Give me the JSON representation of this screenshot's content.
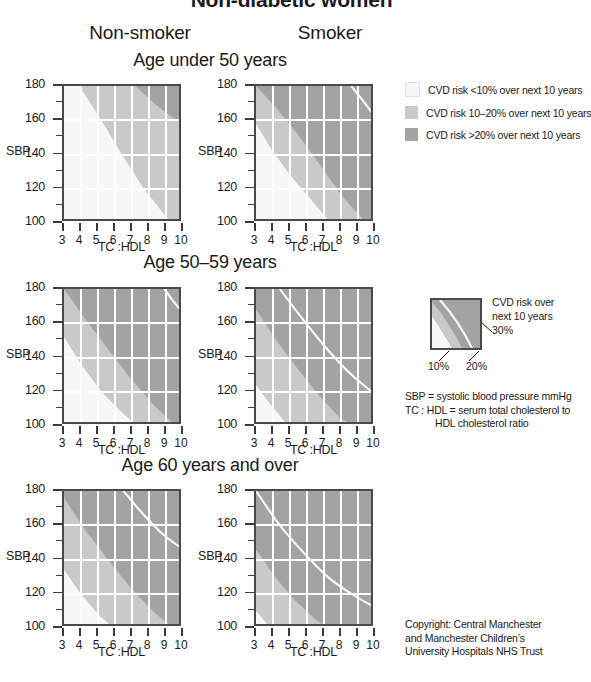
{
  "title": "Non-diabetic women",
  "columns": [
    {
      "label": "Non-smoker"
    },
    {
      "label": "Smoker"
    }
  ],
  "age_groups": [
    {
      "label": "Age under 50 years"
    },
    {
      "label": "Age 50–59 years"
    },
    {
      "label": "Age 60 years and over"
    }
  ],
  "axes": {
    "y_title": "SBP",
    "x_title": "TC :HDL",
    "y_ticks": [
      100,
      120,
      140,
      160,
      180
    ],
    "y_minor_step": 10,
    "y_min": 100,
    "y_max": 180,
    "x_ticks": [
      3,
      4,
      5,
      6,
      7,
      8,
      9,
      10
    ],
    "x_min": 3,
    "x_max": 10
  },
  "colors": {
    "risk_low": "#f7f7f7",
    "risk_mid": "#c9c9c9",
    "risk_high": "#a3a3a3",
    "border": "#4a4a4a",
    "gridline": "#ffffff",
    "contour": "#ffffff",
    "text": "#1a1a1a"
  },
  "legend": {
    "items": [
      {
        "swatch": "risk_low",
        "text": "CVD risk <10% over next 10 years"
      },
      {
        "swatch": "risk_mid",
        "text": "CVD risk 10–20% over next 10 years"
      },
      {
        "swatch": "risk_high",
        "text": "CVD risk >20% over next 10 years"
      }
    ]
  },
  "mini_key": {
    "line1": "CVD risk over",
    "line2": "next 10 years",
    "label_30": "30%",
    "label_10": "10%",
    "label_20": "20%"
  },
  "definitions": {
    "line1": "SBP = systolic blood pressure mmHg",
    "line2": "TC : HDL = serum total cholesterol to",
    "line3": "HDL cholesterol ratio"
  },
  "copyright": {
    "line1": "Copyright: Central Manchester",
    "line2": "and Manchester Children’s",
    "line3": "University Hospitals NHS Trust"
  },
  "chart_data": {
    "type": "heatmap",
    "title": "Non-diabetic women",
    "xlabel": "TC :HDL",
    "ylabel": "SBP",
    "xlim": [
      3,
      10
    ],
    "ylim": [
      100,
      180
    ],
    "grid": true,
    "legend_position": "right",
    "risk_bands": [
      {
        "name": "<10%",
        "color": "#f7f7f7"
      },
      {
        "name": "10-20%",
        "color": "#c9c9c9"
      },
      {
        "name": ">20%",
        "color": "#a3a3a3"
      }
    ],
    "panels": [
      {
        "id": "nonsmoker-under50",
        "age_group": "Age under 50 years",
        "smoking": "Non-smoker",
        "contours": [
          {
            "level": 10,
            "points": [
              [
                3.0,
                180
              ],
              [
                3.9,
                180
              ],
              [
                5.2,
                160
              ],
              [
                6.4,
                140
              ],
              [
                7.7,
                120
              ],
              [
                9.3,
                100
              ]
            ]
          },
          {
            "level": 20,
            "points": [
              [
                7.2,
                180
              ],
              [
                8.3,
                170
              ],
              [
                9.3,
                162
              ],
              [
                10.0,
                158
              ]
            ]
          }
        ],
        "contour_30_visible": false
      },
      {
        "id": "smoker-under50",
        "age_group": "Age under 50 years",
        "smoking": "Smoker",
        "contours": [
          {
            "level": 10,
            "points": [
              [
                3.0,
                158
              ],
              [
                3.9,
                143
              ],
              [
                5.0,
                128
              ],
              [
                6.2,
                114
              ],
              [
                7.4,
                100
              ]
            ]
          },
          {
            "level": 20,
            "points": [
              [
                3.0,
                180
              ],
              [
                4.3,
                166
              ],
              [
                5.6,
                150
              ],
              [
                6.9,
                132
              ],
              [
                8.2,
                114
              ],
              [
                9.5,
                100
              ]
            ]
          },
          {
            "level": 30,
            "points": [
              [
                8.6,
                180
              ],
              [
                9.4,
                170
              ],
              [
                10.0,
                162
              ]
            ]
          }
        ],
        "contour_30_visible": true
      },
      {
        "id": "nonsmoker-50-59",
        "age_group": "Age 50–59 years",
        "smoking": "Non-smoker",
        "contours": [
          {
            "level": 10,
            "points": [
              [
                3.0,
                152
              ],
              [
                4.0,
                136
              ],
              [
                5.2,
                120
              ],
              [
                6.4,
                108
              ],
              [
                7.3,
                100
              ]
            ]
          },
          {
            "level": 20,
            "points": [
              [
                3.0,
                180
              ],
              [
                4.2,
                163
              ],
              [
                5.5,
                146
              ],
              [
                6.9,
                128
              ],
              [
                8.3,
                112
              ],
              [
                9.6,
                100
              ]
            ]
          },
          {
            "level": 30,
            "points": [
              [
                8.9,
                180
              ],
              [
                9.5,
                172
              ],
              [
                10.0,
                166
              ]
            ]
          }
        ],
        "contour_30_visible": true
      },
      {
        "id": "smoker-50-59",
        "age_group": "Age 50–59 years",
        "smoking": "Smoker",
        "contours": [
          {
            "level": 10,
            "points": [
              [
                3.0,
                124
              ],
              [
                3.9,
                112
              ],
              [
                4.9,
                100
              ]
            ]
          },
          {
            "level": 20,
            "points": [
              [
                3.0,
                168
              ],
              [
                4.2,
                150
              ],
              [
                5.4,
                134
              ],
              [
                6.7,
                118
              ],
              [
                8.0,
                104
              ],
              [
                8.9,
                100
              ]
            ]
          },
          {
            "level": 30,
            "points": [
              [
                4.4,
                180
              ],
              [
                5.7,
                163
              ],
              [
                7.0,
                147
              ],
              [
                8.4,
                132
              ],
              [
                9.8,
                120
              ]
            ]
          }
        ],
        "contour_30_visible": true
      },
      {
        "id": "nonsmoker-60plus",
        "age_group": "Age 60 years and over",
        "smoking": "Non-smoker",
        "contours": [
          {
            "level": 10,
            "points": [
              [
                3.0,
                134
              ],
              [
                3.9,
                121
              ],
              [
                5.0,
                108
              ],
              [
                5.9,
                100
              ]
            ]
          },
          {
            "level": 20,
            "points": [
              [
                3.0,
                176
              ],
              [
                4.2,
                158
              ],
              [
                5.5,
                141
              ],
              [
                6.8,
                125
              ],
              [
                8.1,
                111
              ],
              [
                9.4,
                100
              ]
            ]
          },
          {
            "level": 30,
            "points": [
              [
                6.5,
                180
              ],
              [
                7.7,
                166
              ],
              [
                8.9,
                154
              ],
              [
                10.0,
                146
              ]
            ]
          }
        ],
        "contour_30_visible": true
      },
      {
        "id": "smoker-60plus",
        "age_group": "Age 60 years and over",
        "smoking": "Smoker",
        "contours": [
          {
            "level": 10,
            "points": [
              [
                3.0,
                110
              ],
              [
                3.7,
                102
              ],
              [
                3.9,
                100
              ]
            ]
          },
          {
            "level": 20,
            "points": [
              [
                3.0,
                146
              ],
              [
                4.1,
                130
              ],
              [
                5.3,
                116
              ],
              [
                6.5,
                105
              ],
              [
                7.2,
                100
              ]
            ]
          },
          {
            "level": 30,
            "points": [
              [
                3.0,
                180
              ],
              [
                4.4,
                160
              ],
              [
                5.8,
                144
              ],
              [
                7.2,
                130
              ],
              [
                8.6,
                120
              ],
              [
                10.0,
                112
              ]
            ]
          }
        ],
        "contour_30_visible": true
      }
    ]
  }
}
